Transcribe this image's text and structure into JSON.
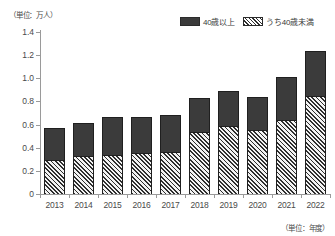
{
  "chart_data": {
    "type": "bar",
    "stacked": true,
    "title": "",
    "xlabel": "（単位：年度）",
    "ylabel": "（単位：万人）",
    "categories": [
      "2013",
      "2014",
      "2015",
      "2016",
      "2017",
      "2018",
      "2019",
      "2020",
      "2021",
      "2022"
    ],
    "ylim": [
      0,
      1.4
    ],
    "ytick_labels": [
      "0",
      "0.2",
      "0.4",
      "0.6",
      "0.8",
      "1.0",
      "1.2",
      "1.4"
    ],
    "ytick_values": [
      0,
      0.2,
      0.4,
      0.6,
      0.8,
      1.0,
      1.2,
      1.4
    ],
    "grid": false,
    "legend_position": "top-right",
    "series": [
      {
        "name": "40歳以上",
        "style": "solid-dark",
        "color": "#3b3b3b",
        "note": "total bar height (cumulative top of stack)",
        "values": [
          0.57,
          0.61,
          0.665,
          0.665,
          0.68,
          0.83,
          0.89,
          0.84,
          1.01,
          1.235
        ]
      },
      {
        "name": "うち40歳未満",
        "style": "diagonal-hatch",
        "color": "#2e2e2e",
        "note": "lower hatched segment, subset of total",
        "values": [
          0.29,
          0.33,
          0.34,
          0.355,
          0.36,
          0.54,
          0.59,
          0.555,
          0.64,
          0.85
        ]
      }
    ]
  },
  "legend": {
    "items": [
      {
        "label": "40歳以上",
        "swatch": "solid"
      },
      {
        "label": "うち40歳未満",
        "swatch": "hatch"
      }
    ]
  },
  "axis": {
    "unit_top": "（単位：万人）",
    "unit_bottom": "（単位：年度）"
  }
}
